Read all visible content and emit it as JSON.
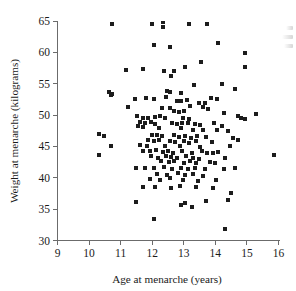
{
  "figure": {
    "background_color": "#ffffff",
    "axis_color": "#6b6b6b",
    "marker_color": "#1c1c1c",
    "text_color": "#1a1a1a"
  },
  "chart_data": {
    "type": "scatter",
    "title": "",
    "subtitle": "",
    "xlabel": "Age at menarche (years)",
    "ylabel": "Weight at menarche (kilograms)",
    "xlim": [
      9,
      16
    ],
    "ylim": [
      30,
      65
    ],
    "xticks": [
      9,
      10,
      11,
      12,
      13,
      14,
      15,
      16
    ],
    "yticks": [
      30,
      35,
      40,
      45,
      50,
      55,
      60,
      65
    ],
    "xtick_labels": [
      "9",
      "10",
      "11",
      "12",
      "13",
      "14",
      "15",
      "16"
    ],
    "ytick_labels": [
      "30",
      "35",
      "40",
      "45",
      "50",
      "55",
      "60",
      "65"
    ],
    "grid": false,
    "legend": null,
    "legend_position": "none",
    "spines": [
      "left",
      "bottom"
    ],
    "marker": "square",
    "marker_size_px": 4,
    "n_points": 183,
    "annotations": [],
    "points": [
      [
        10.72,
        64.6
      ],
      [
        11.98,
        64.6
      ],
      [
        12.33,
        64.9
      ],
      [
        12.33,
        64.0
      ],
      [
        13.18,
        64.6
      ],
      [
        13.72,
        64.6
      ],
      [
        14.08,
        61.5
      ],
      [
        12.05,
        61.2
      ],
      [
        12.57,
        60.8
      ],
      [
        14.93,
        59.9
      ],
      [
        13.55,
        58.4
      ],
      [
        14.95,
        57.6
      ],
      [
        11.18,
        57.2
      ],
      [
        11.72,
        57.3
      ],
      [
        13.05,
        57.6
      ],
      [
        12.68,
        57.0
      ],
      [
        12.38,
        57.1
      ],
      [
        12.6,
        56.3
      ],
      [
        13.32,
        54.8
      ],
      [
        14.2,
        54.9
      ],
      [
        14.62,
        54.2
      ],
      [
        12.48,
        53.8
      ],
      [
        12.55,
        53.6
      ],
      [
        12.9,
        53.5
      ],
      [
        10.62,
        53.6
      ],
      [
        10.72,
        53.4
      ],
      [
        10.7,
        53.2
      ],
      [
        12.43,
        52.9
      ],
      [
        13.85,
        52.7
      ],
      [
        14.05,
        52.5
      ],
      [
        11.45,
        52.6
      ],
      [
        11.8,
        52.7
      ],
      [
        12.05,
        52.6
      ],
      [
        12.78,
        52.3
      ],
      [
        12.92,
        52.2
      ],
      [
        13.1,
        52.4
      ],
      [
        13.48,
        52.0
      ],
      [
        13.68,
        51.9
      ],
      [
        11.22,
        51.3
      ],
      [
        12.3,
        51.2
      ],
      [
        12.55,
        51.1
      ],
      [
        13.2,
        51.4
      ],
      [
        13.6,
        51.3
      ],
      [
        13.78,
        50.9
      ],
      [
        12.7,
        50.6
      ],
      [
        12.85,
        50.5
      ],
      [
        13.0,
        50.7
      ],
      [
        14.28,
        50.4
      ],
      [
        15.3,
        50.1
      ],
      [
        11.52,
        49.9
      ],
      [
        11.7,
        49.6
      ],
      [
        11.88,
        49.6
      ],
      [
        12.1,
        49.7
      ],
      [
        12.25,
        49.8
      ],
      [
        12.42,
        49.5
      ],
      [
        12.98,
        49.6
      ],
      [
        13.15,
        49.4
      ],
      [
        14.72,
        49.9
      ],
      [
        14.82,
        49.6
      ],
      [
        14.95,
        49.3
      ],
      [
        11.62,
        48.9
      ],
      [
        11.78,
        48.7
      ],
      [
        11.95,
        48.9
      ],
      [
        12.08,
        48.6
      ],
      [
        12.62,
        48.8
      ],
      [
        12.8,
        48.6
      ],
      [
        12.95,
        48.7
      ],
      [
        13.12,
        48.8
      ],
      [
        13.35,
        48.5
      ],
      [
        13.52,
        48.4
      ],
      [
        13.95,
        48.7
      ],
      [
        14.22,
        48.3
      ],
      [
        11.55,
        48.2
      ],
      [
        11.72,
        48.1
      ],
      [
        12.2,
        48.0
      ],
      [
        12.92,
        47.9
      ],
      [
        13.28,
        47.6
      ],
      [
        13.62,
        47.7
      ],
      [
        14.05,
        47.6
      ],
      [
        14.4,
        47.4
      ],
      [
        10.32,
        47.0
      ],
      [
        10.48,
        46.6
      ],
      [
        11.98,
        46.8
      ],
      [
        12.15,
        46.9
      ],
      [
        12.3,
        46.6
      ],
      [
        12.68,
        46.8
      ],
      [
        12.85,
        46.5
      ],
      [
        13.05,
        46.7
      ],
      [
        13.22,
        46.4
      ],
      [
        13.42,
        46.6
      ],
      [
        13.7,
        46.5
      ],
      [
        14.55,
        46.3
      ],
      [
        14.72,
        46.1
      ],
      [
        11.88,
        46.0
      ],
      [
        12.05,
        45.8
      ],
      [
        12.22,
        46.0
      ],
      [
        12.55,
        45.9
      ],
      [
        12.72,
        45.7
      ],
      [
        13.0,
        45.8
      ],
      [
        13.18,
        45.6
      ],
      [
        13.38,
        45.9
      ],
      [
        13.88,
        45.7
      ],
      [
        10.7,
        45.0
      ],
      [
        11.6,
        45.2
      ],
      [
        11.82,
        45.1
      ],
      [
        12.4,
        45.0
      ],
      [
        12.88,
        45.1
      ],
      [
        13.52,
        44.9
      ],
      [
        14.45,
        45.1
      ],
      [
        11.7,
        44.3
      ],
      [
        11.92,
        44.2
      ],
      [
        12.12,
        44.4
      ],
      [
        12.35,
        44.1
      ],
      [
        12.5,
        44.3
      ],
      [
        12.65,
        44.0
      ],
      [
        12.95,
        44.2
      ],
      [
        13.25,
        44.0
      ],
      [
        13.58,
        44.3
      ],
      [
        13.75,
        43.9
      ],
      [
        13.92,
        44.0
      ],
      [
        14.08,
        44.1
      ],
      [
        10.3,
        43.7
      ],
      [
        15.85,
        43.7
      ],
      [
        11.95,
        43.4
      ],
      [
        12.18,
        43.2
      ],
      [
        12.45,
        43.5
      ],
      [
        12.6,
        43.3
      ],
      [
        12.78,
        43.1
      ],
      [
        13.08,
        43.4
      ],
      [
        13.3,
        43.2
      ],
      [
        13.48,
        43.0
      ],
      [
        14.32,
        43.2
      ],
      [
        12.28,
        42.6
      ],
      [
        12.52,
        42.5
      ],
      [
        12.7,
        42.7
      ],
      [
        13.0,
        42.4
      ],
      [
        13.2,
        42.6
      ],
      [
        13.4,
        42.3
      ],
      [
        13.82,
        42.5
      ],
      [
        14.0,
        42.4
      ],
      [
        11.48,
        41.5
      ],
      [
        11.78,
        41.5
      ],
      [
        12.05,
        41.6
      ],
      [
        12.38,
        41.7
      ],
      [
        12.62,
        41.4
      ],
      [
        12.9,
        41.6
      ],
      [
        13.12,
        41.4
      ],
      [
        13.35,
        41.5
      ],
      [
        13.68,
        41.4
      ],
      [
        14.28,
        41.4
      ],
      [
        14.62,
        41.6
      ],
      [
        12.15,
        40.6
      ],
      [
        12.48,
        40.5
      ],
      [
        12.82,
        40.7
      ],
      [
        13.05,
        40.4
      ],
      [
        13.3,
        40.6
      ],
      [
        13.6,
        40.3
      ],
      [
        11.92,
        39.8
      ],
      [
        12.25,
        39.6
      ],
      [
        12.55,
        39.9
      ],
      [
        12.98,
        39.7
      ],
      [
        13.45,
        39.5
      ],
      [
        14.02,
        39.6
      ],
      [
        11.7,
        38.5
      ],
      [
        12.1,
        38.6
      ],
      [
        12.58,
        38.4
      ],
      [
        12.88,
        38.7
      ],
      [
        13.38,
        38.5
      ],
      [
        13.92,
        38.4
      ],
      [
        14.48,
        37.6
      ],
      [
        14.4,
        36.5
      ],
      [
        11.48,
        36.2
      ],
      [
        13.05,
        36.0
      ],
      [
        13.7,
        36.3
      ],
      [
        12.92,
        35.7
      ],
      [
        13.25,
        35.4
      ],
      [
        12.05,
        33.5
      ],
      [
        14.3,
        31.8
      ]
    ]
  },
  "margin_note": {
    "visible": true,
    "text": ""
  }
}
